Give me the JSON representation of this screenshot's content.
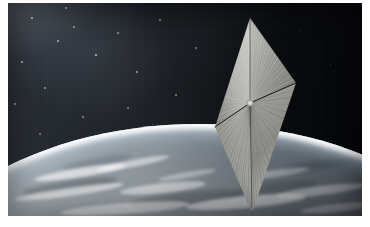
{
  "image": {
    "domain": "Natural-Image",
    "title": "Solar sail spacecraft in orbit above Earth",
    "subject": "LightSail-style square solar sail, artist rendering",
    "caption": "",
    "frame": {
      "canvas_width": 370,
      "canvas_height": 227,
      "photo_x": 8,
      "photo_y": 3,
      "photo_width": 354,
      "photo_height": 213,
      "border_color": "#ffffff"
    }
  },
  "palette": {
    "space_upper_left": "#2a2f38",
    "space_right": "#020305",
    "sail_highlight": "#d7d7d3",
    "sail_midtone": "#9d9e99",
    "sail_shadow": "#6a6c68",
    "earth_light": "#c9cfd4",
    "earth_mid": "#8d959c",
    "earth_dark": "#3d464f",
    "atmosphere_rim": "#ffffff",
    "cloud": "#f2f4f5",
    "boom_dark": "#15171a",
    "star": "#ffffff"
  },
  "scene": {
    "space": {
      "label": "Deep space star field",
      "gradient_from": "#2a2f38",
      "gradient_to": "#020305",
      "nebula_glow_corner": "upper-left",
      "stars": [
        {
          "x": 32,
          "y": 18,
          "r": 0.9,
          "o": 0.75
        },
        {
          "x": 58,
          "y": 41,
          "r": 0.7,
          "o": 0.55
        },
        {
          "x": 22,
          "y": 62,
          "r": 0.8,
          "o": 0.6
        },
        {
          "x": 74,
          "y": 27,
          "r": 0.6,
          "o": 0.45
        },
        {
          "x": 96,
          "y": 55,
          "r": 0.9,
          "o": 0.7
        },
        {
          "x": 45,
          "y": 88,
          "r": 0.7,
          "o": 0.5
        },
        {
          "x": 118,
          "y": 33,
          "r": 0.6,
          "o": 0.42
        },
        {
          "x": 137,
          "y": 72,
          "r": 0.8,
          "o": 0.55
        },
        {
          "x": 15,
          "y": 104,
          "r": 0.7,
          "o": 0.48
        },
        {
          "x": 83,
          "y": 117,
          "r": 0.6,
          "o": 0.4
        },
        {
          "x": 160,
          "y": 20,
          "r": 0.7,
          "o": 0.45
        },
        {
          "x": 176,
          "y": 95,
          "r": 0.6,
          "o": 0.38
        },
        {
          "x": 108,
          "y": 140,
          "r": 0.6,
          "o": 0.34
        },
        {
          "x": 196,
          "y": 48,
          "r": 0.6,
          "o": 0.33
        },
        {
          "x": 66,
          "y": 8,
          "r": 0.8,
          "o": 0.58
        },
        {
          "x": 128,
          "y": 108,
          "r": 0.6,
          "o": 0.36
        },
        {
          "x": 40,
          "y": 134,
          "r": 0.6,
          "o": 0.32
        },
        {
          "x": 152,
          "y": 124,
          "r": 0.5,
          "o": 0.3
        },
        {
          "x": 300,
          "y": 30,
          "r": 0.5,
          "o": 0.26
        },
        {
          "x": 330,
          "y": 64,
          "r": 0.5,
          "o": 0.24
        }
      ]
    },
    "earth": {
      "label": "Earth limb with atmosphere and cloud bands",
      "limb_left_y": 148,
      "limb_apex_y": 142,
      "limb_right_y": 176,
      "atmosphere_rim_color": "#ffffff",
      "surface_from": "#c9cfd4",
      "surface_to": "#3d464f",
      "clouds": [
        {
          "x": 34,
          "y": 168,
          "w": 92,
          "h": 9,
          "rot": -9,
          "o": 0.8
        },
        {
          "x": 96,
          "y": 160,
          "w": 74,
          "h": 7,
          "rot": -11,
          "o": 0.66
        },
        {
          "x": 14,
          "y": 188,
          "w": 110,
          "h": 8,
          "rot": -8,
          "o": 0.72
        },
        {
          "x": 120,
          "y": 183,
          "w": 86,
          "h": 10,
          "rot": -6,
          "o": 0.62
        },
        {
          "x": 186,
          "y": 196,
          "w": 120,
          "h": 12,
          "rot": -5,
          "o": 0.7
        },
        {
          "x": 240,
          "y": 170,
          "w": 70,
          "h": 7,
          "rot": -8,
          "o": 0.52
        },
        {
          "x": 276,
          "y": 186,
          "w": 90,
          "h": 9,
          "rot": -7,
          "o": 0.58
        },
        {
          "x": 60,
          "y": 203,
          "w": 130,
          "h": 11,
          "rot": -4,
          "o": 0.64
        },
        {
          "x": 158,
          "y": 172,
          "w": 58,
          "h": 6,
          "rot": -10,
          "o": 0.48
        },
        {
          "x": 300,
          "y": 204,
          "w": 72,
          "h": 8,
          "rot": -6,
          "o": 0.5
        }
      ],
      "dark_patches": [
        {
          "x": 22,
          "y": 180,
          "w": 96,
          "h": 12,
          "rot": -8,
          "o": 0.5
        },
        {
          "x": 130,
          "y": 192,
          "w": 110,
          "h": 14,
          "rot": -6,
          "o": 0.46
        },
        {
          "x": 232,
          "y": 182,
          "w": 86,
          "h": 12,
          "rot": -7,
          "o": 0.4
        },
        {
          "x": 62,
          "y": 158,
          "w": 70,
          "h": 8,
          "rot": -10,
          "o": 0.34
        },
        {
          "x": 284,
          "y": 160,
          "w": 78,
          "h": 9,
          "rot": -8,
          "o": 0.44
        }
      ]
    },
    "solar_sail": {
      "label": "Four-quadrant square solar sail",
      "shape": "diamond",
      "vertices": {
        "top": {
          "x": 250,
          "y": 18
        },
        "right": {
          "x": 296,
          "y": 83
        },
        "hub": {
          "x": 250,
          "y": 103
        },
        "left": {
          "x": 215,
          "y": 127
        },
        "bottom": {
          "x": 252,
          "y": 213
        }
      },
      "hub": {
        "x": 250,
        "y": 103,
        "radius": 3.4,
        "color": "#e2e2de"
      },
      "quadrant_count": 4,
      "quadrants": [
        {
          "name": "upper-left",
          "tone": "#b9bab5"
        },
        {
          "name": "upper-right",
          "tone": "#9c9d98"
        },
        {
          "name": "lower-left",
          "tone": "#a9aaa5"
        },
        {
          "name": "lower-right",
          "tone": "#8d8e89"
        }
      ],
      "booms": [
        {
          "name": "boom-upper-right",
          "from": "hub",
          "to": "right",
          "color": "#16181b",
          "width": 1.0
        },
        {
          "name": "boom-lower-left",
          "from": "hub",
          "to": "left",
          "color": "#1a1c20",
          "width": 1.0
        },
        {
          "name": "boom-top",
          "from": "hub",
          "to": "top",
          "color": "#2a2c2f",
          "width": 0.6
        },
        {
          "name": "boom-bottom",
          "from": "hub",
          "to": "bottom",
          "color": "#2a2c2f",
          "width": 0.6
        }
      ],
      "crease_line_count": 72,
      "material": "reflective aluminized mylar"
    }
  }
}
